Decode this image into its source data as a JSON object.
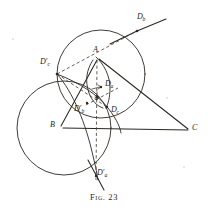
{
  "figure": {
    "caption_prefix": "Fig.",
    "caption_number": "23",
    "caption_full": "Fig. 23",
    "kind": "euclidean-geometry-diagram",
    "background_color": "#ffffff",
    "ink_color": "#2b2722"
  },
  "vertices": [
    {
      "id": "A",
      "label": "A",
      "x": 96,
      "y": 56
    },
    {
      "id": "B",
      "label": "B",
      "x": 58,
      "y": 128
    },
    {
      "id": "C",
      "label": "C",
      "x": 192,
      "y": 129
    }
  ],
  "points": [
    {
      "id": "Da",
      "base": "D",
      "sub": "a",
      "prime": false,
      "label": "Da",
      "x": 101,
      "y": 87,
      "label_x": 105,
      "label_y": 83
    },
    {
      "id": "Db",
      "base": "D",
      "sub": "b",
      "prime": false,
      "label": "Db",
      "x": 138,
      "y": 30,
      "label_x": 139,
      "label_y": 18
    },
    {
      "id": "Dc",
      "base": "D",
      "sub": "c",
      "prime": false,
      "label": "Dc",
      "x": 107,
      "y": 107,
      "label_x": 112,
      "label_y": 108
    },
    {
      "id": "Dap",
      "base": "D",
      "sub": "a",
      "prime": true,
      "label": "D'a",
      "x": 95,
      "y": 175,
      "label_x": 97,
      "label_y": 170
    },
    {
      "id": "Dbp",
      "base": "D",
      "sub": "b",
      "prime": true,
      "label": "D'b",
      "x": 86,
      "y": 105,
      "label_x": 75,
      "label_y": 108
    },
    {
      "id": "Dcp",
      "base": "D",
      "sub": "c",
      "prime": true,
      "label": "D'c",
      "x": 57,
      "y": 74,
      "label_x": 41,
      "label_y": 60
    }
  ],
  "circles": [
    {
      "id": "top-circle",
      "name": "upper-circle",
      "cx": 101,
      "cy": 74,
      "r": 44,
      "style": "solid"
    },
    {
      "id": "left-circle",
      "name": "lower-left-circle",
      "cx": 64,
      "cy": 128,
      "r": 47,
      "style": "solid"
    },
    {
      "id": "incircle-arc",
      "name": "incircle-arc",
      "cx": 98,
      "cy": 92,
      "r": 13,
      "style": "solid-partial"
    }
  ],
  "segments": [
    {
      "id": "side-ab",
      "name": "side-AB",
      "from": "A",
      "to": "B",
      "style": "solid"
    },
    {
      "id": "side-bc",
      "name": "side-BC",
      "from": "B",
      "to": "C",
      "style": "solid"
    },
    {
      "id": "side-ca",
      "name": "side-CA",
      "from": "C",
      "to": "A",
      "style": "solid"
    },
    {
      "id": "cevian-a",
      "name": "cevian-through-Da",
      "style": "dashed"
    },
    {
      "id": "cevian-b",
      "name": "cevian-through-Db",
      "style": "dashed"
    },
    {
      "id": "cevian-c",
      "name": "cevian-through-Dc",
      "style": "dashed"
    },
    {
      "id": "axis-vertical",
      "name": "vertical-dashed-axis",
      "style": "dashed"
    },
    {
      "id": "tangent-top-right",
      "name": "tangent-line-at-Db",
      "style": "solid"
    },
    {
      "id": "tangent-bottom",
      "name": "tangent-line-at-Da-prime",
      "style": "solid"
    }
  ],
  "labels": {
    "A": "A",
    "B": "B",
    "C": "C",
    "Da": "D",
    "Db": "D",
    "Dc": "D",
    "sub_a": "a",
    "sub_b": "b",
    "sub_c": "c",
    "prime_mark": "′"
  }
}
